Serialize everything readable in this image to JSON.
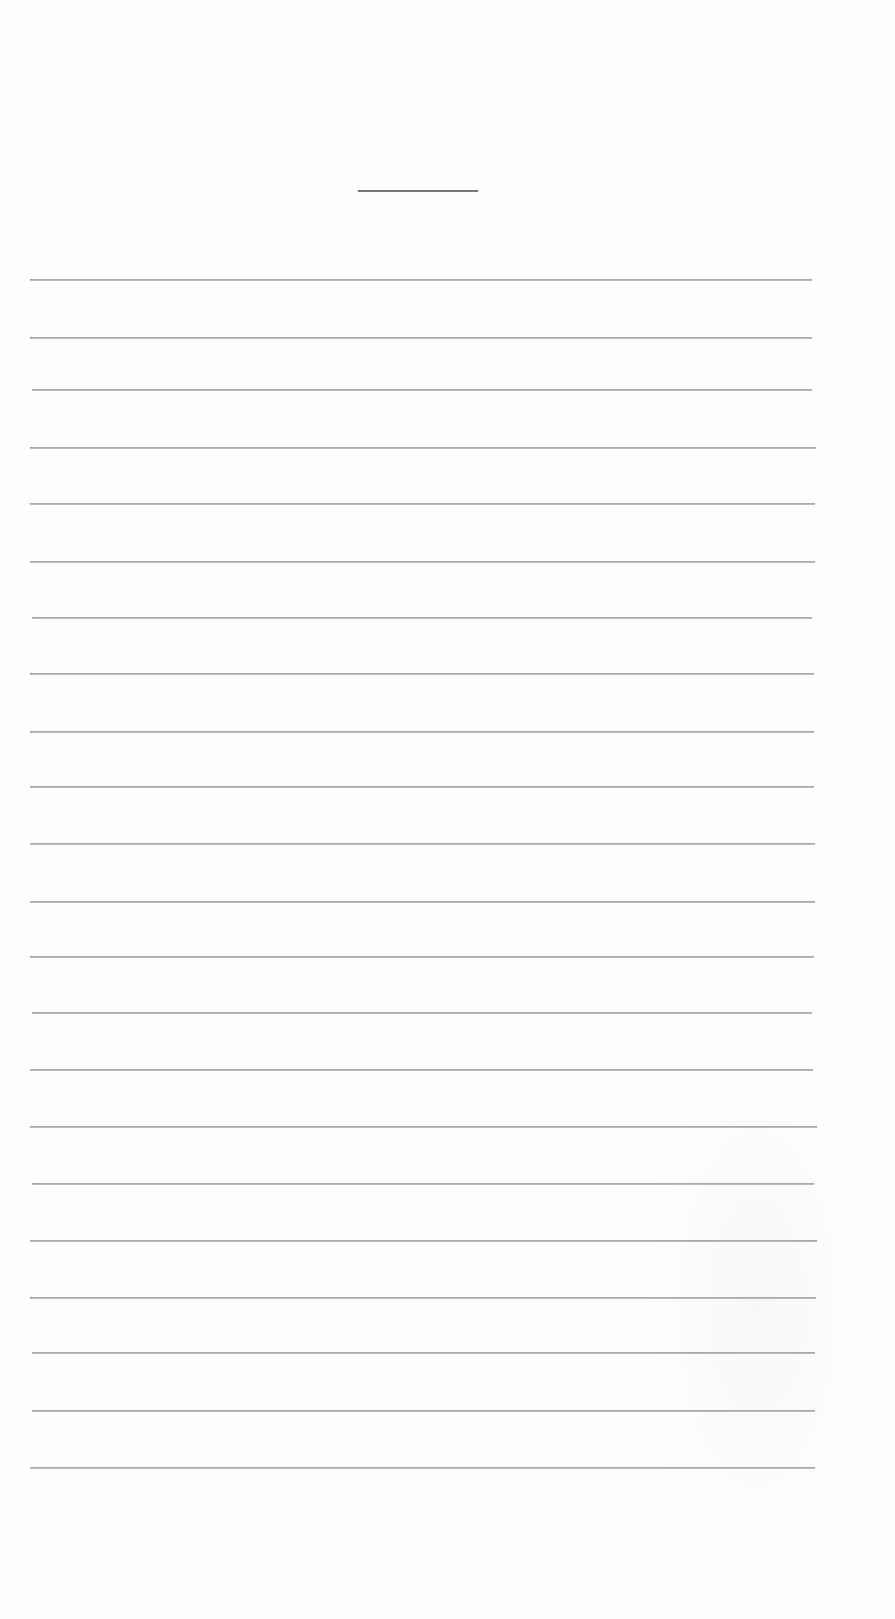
{
  "document": {
    "type": "lined-paper",
    "background_color": "#ffffff",
    "line_color": "#9a9a9a",
    "title_rule": {
      "x": 358,
      "y": 190,
      "width": 120
    },
    "lines": [
      {
        "y": 279,
        "x1": 30,
        "x2": 812
      },
      {
        "y": 337,
        "x1": 30,
        "x2": 812
      },
      {
        "y": 389,
        "x1": 32,
        "x2": 812
      },
      {
        "y": 447,
        "x1": 30,
        "x2": 816
      },
      {
        "y": 503,
        "x1": 30,
        "x2": 815
      },
      {
        "y": 561,
        "x1": 30,
        "x2": 815
      },
      {
        "y": 617,
        "x1": 32,
        "x2": 812
      },
      {
        "y": 673,
        "x1": 30,
        "x2": 814
      },
      {
        "y": 731,
        "x1": 30,
        "x2": 814
      },
      {
        "y": 786,
        "x1": 30,
        "x2": 814
      },
      {
        "y": 843,
        "x1": 30,
        "x2": 815
      },
      {
        "y": 901,
        "x1": 30,
        "x2": 815
      },
      {
        "y": 956,
        "x1": 30,
        "x2": 814
      },
      {
        "y": 1012,
        "x1": 32,
        "x2": 812
      },
      {
        "y": 1069,
        "x1": 30,
        "x2": 813
      },
      {
        "y": 1126,
        "x1": 30,
        "x2": 817
      },
      {
        "y": 1183,
        "x1": 32,
        "x2": 814
      },
      {
        "y": 1240,
        "x1": 30,
        "x2": 817
      },
      {
        "y": 1297,
        "x1": 30,
        "x2": 816
      },
      {
        "y": 1352,
        "x1": 32,
        "x2": 815
      },
      {
        "y": 1410,
        "x1": 32,
        "x2": 815
      },
      {
        "y": 1467,
        "x1": 30,
        "x2": 815
      }
    ]
  }
}
